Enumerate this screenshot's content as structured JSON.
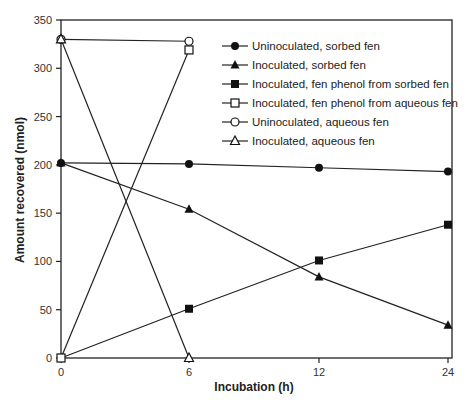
{
  "chart_data": {
    "type": "line",
    "title": "",
    "xlabel": "Incubation (h)",
    "ylabel": "Amount recovered (nmol)",
    "x": [
      0,
      6,
      12,
      24
    ],
    "x_tick_labels": [
      "0",
      "6",
      "12",
      "24"
    ],
    "y_ticks": [
      0,
      50,
      100,
      150,
      200,
      250,
      300,
      350
    ],
    "y_tick_labels": [
      "0",
      "50",
      "100",
      "150",
      "200",
      "250",
      "300",
      "350"
    ],
    "ylim": [
      0,
      350
    ],
    "grid": false,
    "legend_position": "upper right (inside)",
    "series": [
      {
        "name": "Uninoculated, sorbed fen",
        "marker": "filled-circle",
        "x": [
          0,
          6,
          12,
          24
        ],
        "values": [
          202,
          201,
          197,
          193
        ]
      },
      {
        "name": "Inoculated, sorbed fen",
        "marker": "filled-triangle",
        "x": [
          0,
          6,
          12,
          24
        ],
        "values": [
          202,
          154,
          84,
          34
        ]
      },
      {
        "name": "Inoculated, fen phenol from sorbed fen",
        "marker": "filled-square",
        "x": [
          0,
          6,
          12,
          24
        ],
        "values": [
          0,
          51,
          101,
          138
        ]
      },
      {
        "name": "Inoculated, fen phenol from aqueous fen",
        "marker": "open-square",
        "x": [
          0,
          6
        ],
        "values": [
          0,
          319
        ]
      },
      {
        "name": "Uninoculated, aqueous fen",
        "marker": "open-circle",
        "x": [
          0,
          6
        ],
        "values": [
          330,
          328
        ]
      },
      {
        "name": "Inoculated, aqueous fen",
        "marker": "open-triangle",
        "x": [
          0,
          6
        ],
        "values": [
          330,
          0
        ]
      }
    ]
  }
}
